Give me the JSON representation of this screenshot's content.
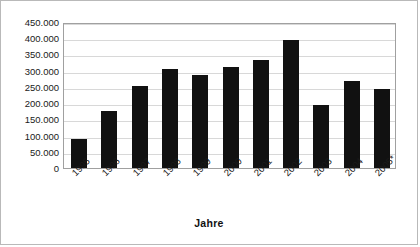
{
  "chart_data": {
    "type": "bar",
    "title": "",
    "xlabel": "Jahre",
    "ylabel": "",
    "categories": [
      "1995",
      "1996",
      "1997",
      "1998",
      "1999",
      "2000",
      "2001",
      "2002",
      "2003",
      "2004",
      "2005*"
    ],
    "values": [
      90000,
      175000,
      252000,
      305000,
      288000,
      310000,
      332000,
      395000,
      195000,
      268000,
      245000
    ],
    "ylim": [
      0,
      450000
    ],
    "ytick_values": [
      0,
      50000,
      100000,
      150000,
      200000,
      250000,
      300000,
      350000,
      400000,
      450000
    ],
    "ytick_labels": [
      "0",
      "50.000",
      "100.000",
      "150.000",
      "200.000",
      "250.000",
      "300.000",
      "350.000",
      "400.000",
      "450.000"
    ],
    "grid": true,
    "legend": false,
    "bar_color": "#111111",
    "grid_color": "#d8d8d8",
    "axis_color": "#a0a0a0",
    "plot_background": "#ffffff"
  }
}
